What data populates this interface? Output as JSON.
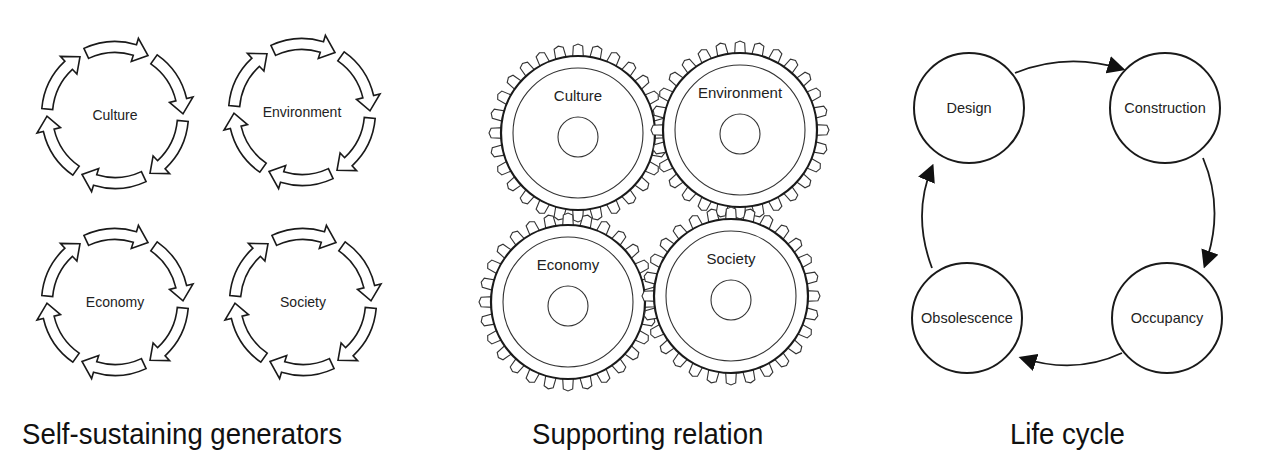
{
  "panels": [
    {
      "caption": "Self-sustaining generators",
      "cycles": [
        {
          "label": "Culture",
          "cx": 115,
          "cy": 115
        },
        {
          "label": "Environment",
          "cx": 302,
          "cy": 112
        },
        {
          "label": "Economy",
          "cx": 115,
          "cy": 302
        },
        {
          "label": "Society",
          "cx": 303,
          "cy": 302
        }
      ]
    },
    {
      "caption": "Supporting relation",
      "gears": [
        {
          "label": "Culture",
          "cx": 578,
          "cy": 133
        },
        {
          "label": "Environment",
          "cx": 740,
          "cy": 130
        },
        {
          "label": "Economy",
          "cx": 568,
          "cy": 302
        },
        {
          "label": "Society",
          "cx": 731,
          "cy": 296
        }
      ]
    },
    {
      "caption": "Life cycle",
      "stages": [
        {
          "label": "Design",
          "cx": 969,
          "cy": 108
        },
        {
          "label": "Construction",
          "cx": 1165,
          "cy": 108
        },
        {
          "label": "Occupancy",
          "cx": 1167,
          "cy": 318
        },
        {
          "label": "Obsolescence",
          "cx": 967,
          "cy": 318
        }
      ]
    }
  ],
  "colors": {
    "stroke": "#1a1a1a",
    "background": "#ffffff"
  }
}
